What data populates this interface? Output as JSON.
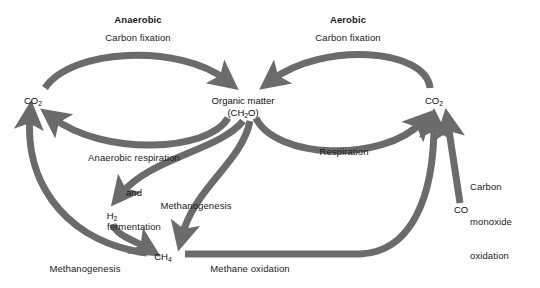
{
  "figure": {
    "title_left": "Anaerobic",
    "title_right": "Aerobic",
    "arrow_color": "#6b6b6b",
    "text_color": "#1a1a1a",
    "background": "#ffffff"
  },
  "nodes": [
    {
      "id": "co2_left",
      "label": "CO",
      "sub": "2",
      "x": 33,
      "y": 100
    },
    {
      "id": "organic_matter",
      "label": "Organic matter",
      "sub": "",
      "x": 243,
      "y": 100
    },
    {
      "id": "organic_formula",
      "label": "(CH",
      "sub": "2",
      "tail": "O)",
      "x": 243,
      "y": 112
    },
    {
      "id": "co2_right",
      "label": "CO",
      "sub": "2",
      "x": 434,
      "y": 100
    },
    {
      "id": "h2",
      "label": "H",
      "sub": "2",
      "x": 112,
      "y": 215
    },
    {
      "id": "ch4",
      "label": "CH",
      "sub": "4",
      "x": 163,
      "y": 256
    },
    {
      "id": "co",
      "label": "CO",
      "sub": "",
      "x": 461,
      "y": 209
    }
  ],
  "process_labels": [
    {
      "id": "carbon_fixation_anaerobic",
      "lines": [
        "Carbon fixation"
      ],
      "x": 138,
      "y": 32
    },
    {
      "id": "carbon_fixation_aerobic",
      "lines": [
        "Carbon fixation"
      ],
      "x": 348,
      "y": 32
    },
    {
      "id": "anaerobic_respiration",
      "lines": [
        "Anaerobic respiration",
        "and",
        "fermentation"
      ],
      "x": 134,
      "y": 130
    },
    {
      "id": "respiration",
      "lines": [
        "Respiration"
      ],
      "x": 344,
      "y": 151
    },
    {
      "id": "methanogenesis_center",
      "lines": [
        "Methanogenesis"
      ],
      "x": 196,
      "y": 205
    },
    {
      "id": "methanogenesis_left",
      "lines": [
        "Methanogenesis"
      ],
      "x": 85,
      "y": 268
    },
    {
      "id": "methane_oxidation",
      "lines": [
        "Methane oxidation"
      ],
      "x": 250,
      "y": 268
    },
    {
      "id": "carbon_monoxide_oxidation",
      "lines": [
        "Carbon",
        "monoxide",
        "oxidation"
      ],
      "x": 495,
      "y": 163
    }
  ],
  "arrows": [
    {
      "id": "arrow-carbon-fixation-anaerobic",
      "from": "co2_left",
      "to": "organic_matter",
      "label": "carbon_fixation_anaerobic"
    },
    {
      "id": "arrow-carbon-fixation-aerobic",
      "from": "co2_right",
      "to": "organic_matter",
      "label": "carbon_fixation_aerobic"
    },
    {
      "id": "arrow-anaerobic-respiration",
      "from": "organic_matter",
      "to": "co2_left",
      "label": "anaerobic_respiration"
    },
    {
      "id": "arrow-respiration",
      "from": "organic_matter",
      "to": "co2_right",
      "label": "respiration"
    },
    {
      "id": "arrow-methanogenesis-h2",
      "from": "organic_matter",
      "to": "h2",
      "label": ""
    },
    {
      "id": "arrow-methanogenesis-ch4",
      "from": "organic_matter",
      "to": "ch4",
      "label": "methanogenesis_center"
    },
    {
      "id": "arrow-h2-to-ch4",
      "from": "h2",
      "to": "ch4",
      "label": ""
    },
    {
      "id": "arrow-methanogenesis-co2",
      "from": "ch4",
      "to": "co2_left",
      "label": "methanogenesis_left"
    },
    {
      "id": "arrow-methane-oxidation",
      "from": "ch4",
      "to": "co2_right",
      "label": "methane_oxidation"
    },
    {
      "id": "arrow-co-oxidation",
      "from": "co",
      "to": "co2_right",
      "label": "carbon_monoxide_oxidation"
    }
  ]
}
